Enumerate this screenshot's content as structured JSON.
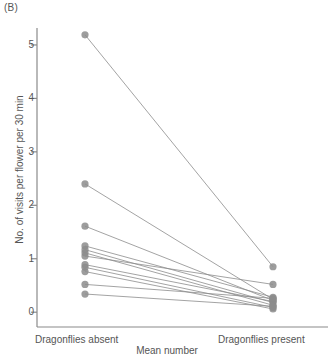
{
  "panel": {
    "label": "(B)"
  },
  "chart_data": {
    "type": "line",
    "title": "",
    "subtitle": "",
    "xlabel": "Mean number",
    "ylabel": "No. of visits per flower per 30 min",
    "categories": [
      "Dragonflies absent",
      "Dragonflies present"
    ],
    "yticks": [
      0,
      1,
      2,
      3,
      4,
      5
    ],
    "ytick_labels": [
      "0",
      "1",
      "2",
      "3",
      "4",
      "5"
    ],
    "ylim": [
      -0.28,
      5.55
    ],
    "grid": false,
    "legend": null,
    "marker": "circle",
    "marker_color": "#8c8c8c",
    "line_color": "#8c8c8c",
    "axis_color": "#8a8a8a",
    "series": [
      {
        "name": "pair-1",
        "values": [
          5.19,
          0.85
        ]
      },
      {
        "name": "pair-2",
        "values": [
          2.4,
          0.24
        ]
      },
      {
        "name": "pair-3",
        "values": [
          1.61,
          0.22
        ]
      },
      {
        "name": "pair-4",
        "values": [
          1.24,
          0.28
        ]
      },
      {
        "name": "pair-5",
        "values": [
          1.17,
          0.18
        ]
      },
      {
        "name": "pair-6",
        "values": [
          1.11,
          0.13
        ]
      },
      {
        "name": "pair-7",
        "values": [
          1.05,
          0.52
        ]
      },
      {
        "name": "pair-8",
        "values": [
          0.89,
          0.2
        ]
      },
      {
        "name": "pair-9",
        "values": [
          0.84,
          0.09
        ]
      },
      {
        "name": "pair-10",
        "values": [
          0.76,
          0.06
        ]
      },
      {
        "name": "pair-11",
        "values": [
          0.52,
          0.26
        ]
      },
      {
        "name": "pair-12",
        "values": [
          0.34,
          0.11
        ]
      }
    ]
  }
}
